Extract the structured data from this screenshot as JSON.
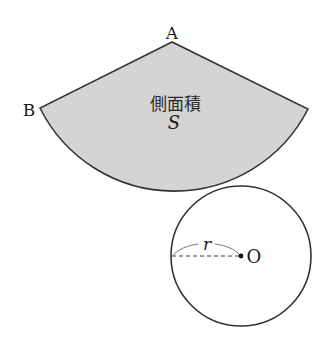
{
  "diagram": {
    "sector": {
      "apex_label": "A",
      "edge_label": "B",
      "area_label": "側面積",
      "area_symbol": "S",
      "fill_color": "#d4d4d4",
      "stroke_color": "#333333"
    },
    "circle": {
      "center_label": "O",
      "radius_label": "r",
      "stroke_color": "#333333"
    }
  }
}
